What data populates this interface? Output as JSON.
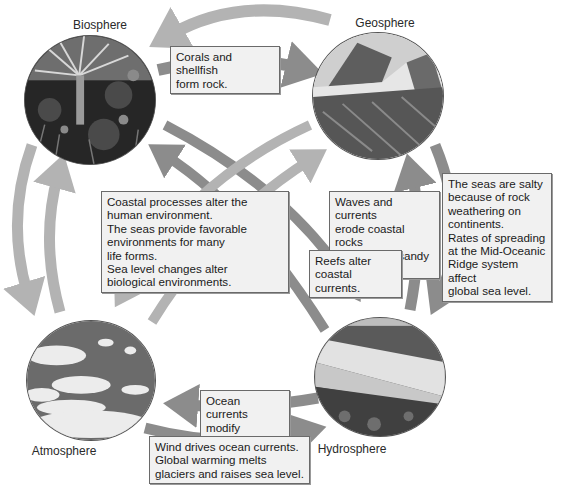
{
  "spheres": {
    "biosphere": {
      "label": "Biosphere",
      "icon": "forest-photo"
    },
    "geosphere": {
      "label": "Geosphere",
      "icon": "mountain-photo"
    },
    "atmosphere": {
      "label": "Atmosphere",
      "icon": "clouds-photo"
    },
    "hydrosphere": {
      "label": "Hydrosphere",
      "icon": "ocean-coast-photo"
    }
  },
  "colors": {
    "arrow_dark": "#8c8c8c",
    "arrow_light": "#b3b3b3",
    "box_bg": "#f1f1f1",
    "box_border": "#6a6a6a"
  },
  "boxes": {
    "corals": [
      "Corals and shellfish",
      "form rock."
    ],
    "coastal": [
      "Coastal processes alter the",
      "human environment.",
      "The seas provide favorable",
      "environments for many",
      "life forms.",
      "Sea level changes alter",
      "biological environments."
    ],
    "waves": [
      "Waves and currents",
      "erode coastal rocks",
      "and deposit sandy",
      "beaches."
    ],
    "reefs": [
      "Reefs alter",
      "coastal currents."
    ],
    "salty": [
      "The seas are salty",
      "because of rock",
      "weathering on",
      "continents.",
      "Rates of spreading",
      "at the Mid-Oceanic",
      "Ridge system affect",
      "global sea level."
    ],
    "ocean_currents": [
      "Ocean currents",
      "modify regional",
      "climates."
    ],
    "wind": [
      "Wind drives ocean currents.",
      "Global warming melts",
      "glaciers and raises sea level."
    ]
  }
}
